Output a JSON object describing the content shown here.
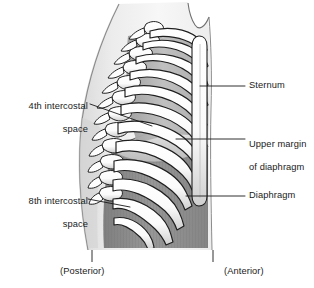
{
  "figure": {
    "colors": {
      "background": "#ffffff",
      "outline": "#1a1a1a",
      "bone_light": "#fdfdfd",
      "bone_shadow": "#c9c9c9",
      "intercostal_light": "#b7b7b7",
      "intercostal_mid": "#a0a0a0",
      "diaphragm_dark": "#8a8a8a",
      "diaphragm_dome": "#d6d6d6",
      "body_tint": "#e8e8e8",
      "text": "#1a1a1a"
    }
  },
  "labels": {
    "intercostal_4th": {
      "line1": "4th intercostal",
      "line2": "space"
    },
    "intercostal_8th": {
      "line1": "8th intercostal",
      "line2": "space"
    },
    "sternum": "Sternum",
    "upper_margin_diaphragm": {
      "line1": "Upper margin",
      "line2": "of diaphragm"
    },
    "diaphragm": "Diaphragm"
  },
  "orientation": {
    "posterior": "(Posterior)",
    "anterior": "(Anterior)"
  },
  "icons": {
    "leader_line": "leader-line",
    "tick_mark": "tick-mark"
  }
}
